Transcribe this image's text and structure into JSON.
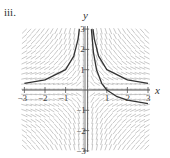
{
  "figure": {
    "part_label": "iii.",
    "x_axis_label": "x",
    "y_axis_label": "y",
    "x_ticks": [
      "-3",
      "-2",
      "-1",
      "1",
      "2",
      "3"
    ],
    "y_ticks": [
      "3",
      "2",
      "1",
      "-1",
      "-2",
      "-3"
    ],
    "x_range": [
      -3,
      3
    ],
    "y_range": [
      -3,
      3
    ],
    "colors": {
      "slope_segments": "#b0b0b0",
      "axes": "#555555",
      "curves": "#333333",
      "text": "#333333"
    }
  },
  "slope_field": {
    "description": "Slope field with solution curves",
    "grid_spacing": 0.25
  },
  "solution_curves": [
    {
      "name": "left-curve",
      "points": [
        [
          -3,
          0.33
        ],
        [
          -2,
          0.5
        ],
        [
          -1,
          1
        ],
        [
          -0.6,
          1.67
        ],
        [
          -0.4,
          2.5
        ],
        [
          -0.33,
          3
        ]
      ]
    },
    {
      "name": "right-upper-curve",
      "points": [
        [
          0.33,
          3
        ],
        [
          0.4,
          2.5
        ],
        [
          0.6,
          1.67
        ],
        [
          1,
          1
        ],
        [
          2,
          0.5
        ],
        [
          3,
          0.33
        ]
      ]
    },
    {
      "name": "right-lower-curve",
      "points": [
        [
          0.25,
          3
        ],
        [
          0.35,
          1.86
        ],
        [
          0.5,
          1
        ],
        [
          0.75,
          0.33
        ],
        [
          1,
          0
        ],
        [
          1.5,
          -0.33
        ],
        [
          2,
          -0.5
        ],
        [
          3,
          -0.67
        ]
      ]
    }
  ]
}
